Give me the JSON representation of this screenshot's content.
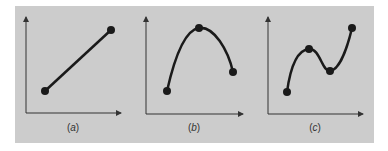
{
  "figure": {
    "background_color": "#cccccc",
    "curve_color": "#1a1a1a",
    "axis_color": "#333333",
    "panels": [
      {
        "id": "a",
        "label": "(a)",
        "description": "linear interpolation through 2 points",
        "points": [
          [
            45,
            91
          ],
          [
            111,
            30
          ]
        ]
      },
      {
        "id": "b",
        "label": "(b)",
        "description": "quadratic interpolation through 3 points",
        "points": [
          [
            167,
            91
          ],
          [
            199,
            28
          ],
          [
            233,
            72
          ]
        ]
      },
      {
        "id": "c",
        "label": "(c)",
        "description": "cubic interpolation through 4 points",
        "points": [
          [
            287,
            92
          ],
          [
            309,
            49
          ],
          [
            330,
            71
          ],
          [
            352,
            28
          ]
        ]
      }
    ]
  },
  "labels": {
    "a_open": "(",
    "a_letter": "a",
    "a_close": ")",
    "b_open": "(",
    "b_letter": "b",
    "b_close": ")",
    "c_open": "(",
    "c_letter": "c",
    "c_close": ")"
  }
}
